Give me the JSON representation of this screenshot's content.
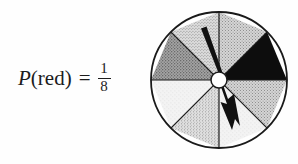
{
  "figure": {
    "background_color": "#fefefe"
  },
  "equation": {
    "variable": "P",
    "open_paren": "(",
    "event": "red",
    "close_paren": ")",
    "equals": "=",
    "numerator": "1",
    "denominator": "8",
    "full_text": "P(red) = 1/8"
  },
  "spinner": {
    "name": "eight-sector-spinner",
    "sector_count": 8,
    "center": {
      "x": 69,
      "y": 74
    },
    "radius": 68,
    "hub_radius": 8,
    "hub_color": "#ffffff",
    "outline_color": "#1a1a1a",
    "sectors": [
      {
        "index": 0,
        "label": "sector-1",
        "start_deg": -90,
        "end_deg": -45,
        "fill": "#b8b8b8",
        "texture": "stipple-light",
        "position": "top-right-upper"
      },
      {
        "index": 1,
        "label": "sector-2-red",
        "start_deg": -45,
        "end_deg": 0,
        "fill": "#0d0d0d",
        "texture": "solid-black",
        "position": "right-upper"
      },
      {
        "index": 2,
        "label": "sector-3",
        "start_deg": 0,
        "end_deg": 45,
        "fill": "#bdbdbd",
        "texture": "stipple-light",
        "position": "right-lower"
      },
      {
        "index": 3,
        "label": "sector-4",
        "start_deg": 45,
        "end_deg": 90,
        "fill": "#f2f2f2",
        "texture": "near-white",
        "position": "bottom-right"
      },
      {
        "index": 4,
        "label": "sector-5",
        "start_deg": 90,
        "end_deg": 135,
        "fill": "#c9c9c9",
        "texture": "stipple-light",
        "position": "bottom-left"
      },
      {
        "index": 5,
        "label": "sector-6",
        "start_deg": 135,
        "end_deg": 180,
        "fill": "#f4f4f4",
        "texture": "near-white",
        "position": "left-lower"
      },
      {
        "index": 6,
        "label": "sector-7",
        "start_deg": 180,
        "end_deg": 225,
        "fill": "#9a9a9a",
        "texture": "stipple-dark",
        "position": "left-upper"
      },
      {
        "index": 7,
        "label": "sector-8",
        "start_deg": 225,
        "end_deg": 270,
        "fill": "#c4c4c4",
        "texture": "stipple-light",
        "position": "top-left"
      }
    ],
    "needle": {
      "name": "spinner-needle",
      "color": "#111111",
      "pointing_deg": -110,
      "description": "black tapered needle from hub toward upper-left"
    },
    "arrow": {
      "name": "spin-direction-arrow",
      "color": "#111111",
      "direction": "clockwise-down-right",
      "description": "zigzag arrow indicating spin direction toward lower-right"
    }
  },
  "colors": {
    "ink": "#1c1c1c",
    "black_sector": "#0d0d0d",
    "page": "#fefefe"
  }
}
